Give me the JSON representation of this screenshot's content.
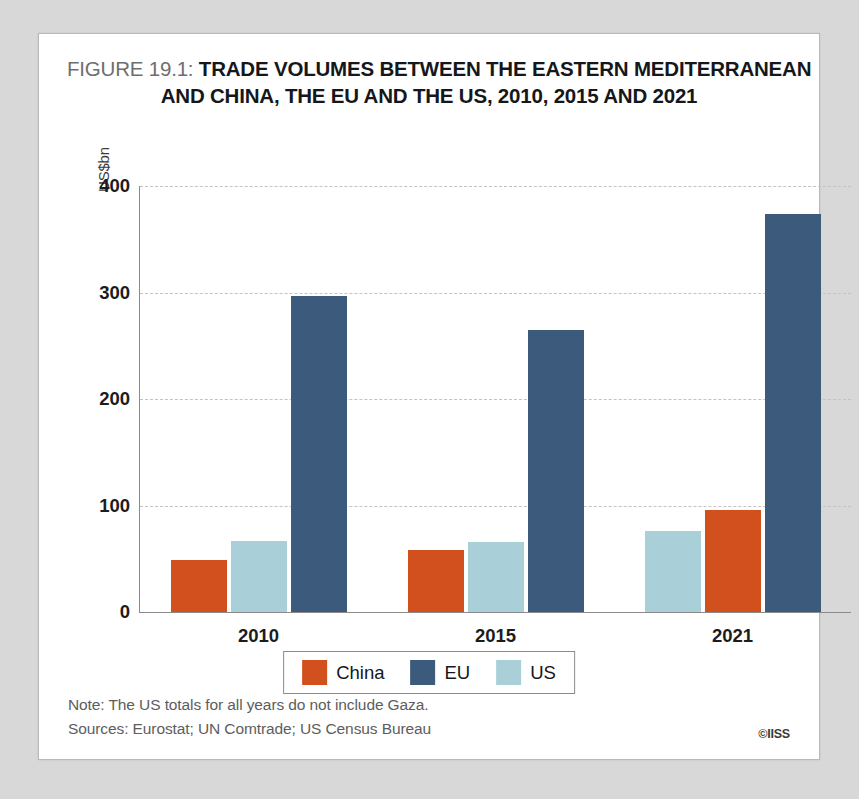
{
  "figure": {
    "label": "FIGURE 19.1:",
    "title_line_1": "TRADE VOLUMES BETWEEN THE EASTERN MEDITERRANEAN",
    "title_line_2": "AND CHINA, THE EU AND THE US, 2010, 2015 AND 2021"
  },
  "notes": {
    "note": "Note: The US totals for all years do not include Gaza.",
    "sources": "Sources: Eurostat; UN Comtrade; US Census Bureau",
    "copyright": "©IISS"
  },
  "colors": {
    "china": "#D2501E",
    "eu": "#3C5A7C",
    "us": "#A9D0D8",
    "gridline": "#C3C3C3",
    "axis": "#8B8B8B",
    "card_background": "#FFFFFF",
    "page_background": "#D8D8D8"
  },
  "chart_data": {
    "type": "bar",
    "title": "FIGURE 19.1: TRADE VOLUMES BETWEEN THE EASTERN MEDITERRANEAN AND CHINA, THE EU AND THE US, 2010, 2015 AND 2021",
    "xlabel": "",
    "ylabel": "US$bn",
    "categories": [
      "2010",
      "2015",
      "2021"
    ],
    "ylim": [
      0,
      400
    ],
    "yticks": [
      0,
      100,
      200,
      300,
      400
    ],
    "ytick_labels": [
      "0",
      "100",
      "200",
      "300",
      "400"
    ],
    "grid": true,
    "legend_position": "bottom-center",
    "legend": [
      "China",
      "EU",
      "US"
    ],
    "series": [
      {
        "name": "China",
        "color": "#D2501E",
        "values": [
          49,
          58,
          96
        ]
      },
      {
        "name": "EU",
        "color": "#3C5A7C",
        "values": [
          297,
          265,
          374
        ]
      },
      {
        "name": "US",
        "color": "#A9D0D8",
        "values": [
          67,
          66,
          76
        ]
      }
    ],
    "group_bar_order": [
      [
        "China",
        "US",
        "EU"
      ],
      [
        "China",
        "US",
        "EU"
      ],
      [
        "US",
        "China",
        "EU"
      ]
    ]
  }
}
